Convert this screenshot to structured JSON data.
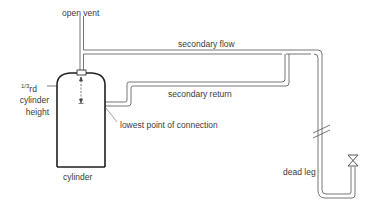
{
  "diagram": {
    "type": "hot water cylinder with secondary circulation and dead leg",
    "labels": {
      "open_vent": "open vent",
      "secondary_flow": "secondary flow",
      "secondary_return": "secondary return",
      "one_third_fraction": "1/3",
      "one_third_suffix": "rd",
      "cylinder_line1": "cylinder",
      "cylinder_line2": "height",
      "lowest_point": "lowest point of connection",
      "cylinder": "cylinder",
      "dead_leg": "dead leg"
    },
    "components": [
      "open vent pipe",
      "cylinder",
      "secondary flow pipe",
      "secondary return pipe",
      "dead leg pipe",
      "valve/tap",
      "break symbol"
    ],
    "colors": {
      "pipe": "#555555",
      "cylinder": "#222222",
      "text": "#3a3a3a"
    }
  }
}
